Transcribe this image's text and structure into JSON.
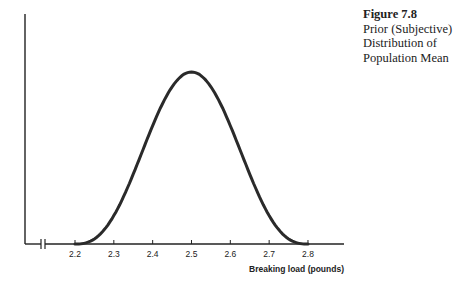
{
  "caption": {
    "figure": "Figure 7.8",
    "lines": [
      "Prior (Subjective)",
      "Distribution of",
      "Population Mean"
    ]
  },
  "chart_data": {
    "type": "line",
    "title": "Prior (Subjective) Distribution of Population Mean",
    "xlabel": "Breaking load (pounds)",
    "ylabel": "",
    "x_ticks": [
      "2.2",
      "2.3",
      "2.4",
      "2.5",
      "2.6",
      "2.7",
      "2.8"
    ],
    "xlim": [
      2.2,
      2.8
    ],
    "axis_break": true,
    "grid": false,
    "legend": null,
    "series": [
      {
        "name": "Prior distribution",
        "shape": "bell curve (bounded)",
        "x": [
          2.2,
          2.25,
          2.3,
          2.35,
          2.4,
          2.45,
          2.5,
          2.55,
          2.6,
          2.65,
          2.7,
          2.75,
          2.8
        ],
        "y_relative": [
          0.0,
          0.09,
          0.23,
          0.44,
          0.69,
          0.91,
          1.0,
          0.91,
          0.69,
          0.44,
          0.23,
          0.09,
          0.0
        ]
      }
    ],
    "peak_x": 2.5
  },
  "axes": {
    "x_label": "Breaking load (pounds)",
    "ticks": [
      "2.2",
      "2.3",
      "2.4",
      "2.5",
      "2.6",
      "2.7",
      "2.8"
    ]
  }
}
